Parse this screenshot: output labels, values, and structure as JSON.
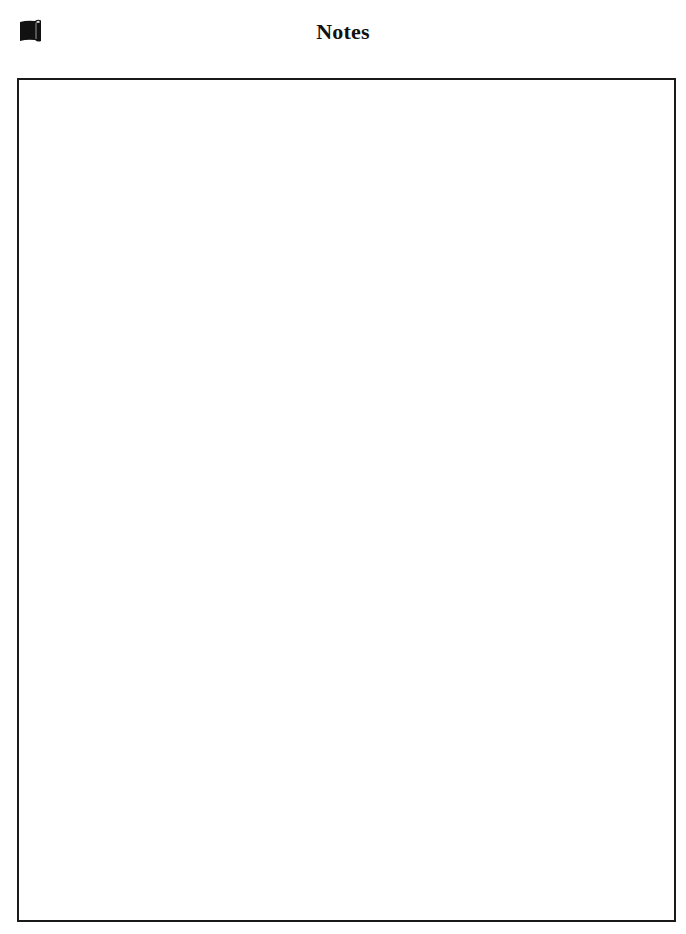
{
  "header": {
    "icon": "scroll-icon",
    "title": "Notes"
  },
  "notes": {
    "content": ""
  },
  "colors": {
    "border": "#1a1a1a",
    "icon": "#111111",
    "background": "#ffffff"
  }
}
